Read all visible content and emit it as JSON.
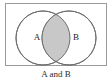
{
  "figure": {
    "type": "venn-diagram",
    "caption": "A and B",
    "background_color": "#ffffff"
  },
  "universe": {
    "name": "universal-set-rectangle",
    "x": 5,
    "y": 3,
    "width": 102,
    "height": 63,
    "stroke_color": "#9a9a9a",
    "fill_color": "#ffffff",
    "stroke_width": 1
  },
  "circles": [
    {
      "label": "A",
      "cx": 43,
      "cy": 38,
      "r": 27,
      "stroke_color": "#6e6e6e",
      "fill_color": "#ffffff",
      "label_x": 37,
      "label_y": 38
    },
    {
      "label": "B",
      "cx": 69,
      "cy": 38,
      "r": 27,
      "stroke_color": "#6e6e6e",
      "fill_color": "#ffffff",
      "label_x": 76,
      "label_y": 38
    }
  ],
  "intersection": {
    "name": "intersection-region",
    "shaded": true,
    "fill_color": "#c8c8c8",
    "stroke_color": "#6e6e6e",
    "meaning": "A and B"
  },
  "caption": {
    "text": "A and B",
    "x": 56,
    "y": 75,
    "color": "#2b2b2b"
  }
}
